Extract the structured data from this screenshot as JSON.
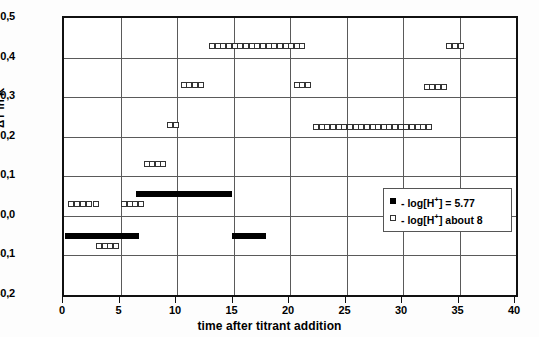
{
  "chart_data": {
    "type": "scatter",
    "title": "",
    "xlabel": "time after titrant addition",
    "ylabel": "ΔT in K",
    "xlim": [
      0,
      40
    ],
    "ylim": [
      -0.2,
      0.5
    ],
    "xticks": [
      "0",
      "5",
      "10",
      "15",
      "20",
      "25",
      "30",
      "35",
      "40"
    ],
    "xtick_values": [
      0,
      5,
      10,
      15,
      20,
      25,
      30,
      35,
      40
    ],
    "yticks": [
      "-0,2",
      "-0,1",
      "0,0",
      "0,1",
      "0,2",
      "0,3",
      "0,4",
      "0,5"
    ],
    "ytick_values": [
      -0.2,
      -0.1,
      0.0,
      0.1,
      0.2,
      0.3,
      0.4,
      0.5
    ],
    "grid": "both",
    "legend_position": "lower-right",
    "decimal_separator": ",",
    "series": [
      {
        "name": "- log[H+] = 5.77",
        "marker": "filled-square",
        "color": "#000000",
        "points": [
          [
            0.35,
            -0.05
          ],
          [
            0.85,
            -0.05
          ],
          [
            1.35,
            -0.05
          ],
          [
            1.85,
            -0.05
          ],
          [
            2.35,
            -0.05
          ],
          [
            2.85,
            -0.05
          ],
          [
            3.35,
            -0.05
          ],
          [
            3.85,
            -0.05
          ],
          [
            4.35,
            -0.05
          ],
          [
            4.85,
            -0.05
          ],
          [
            5.35,
            -0.05
          ],
          [
            5.9,
            -0.05
          ],
          [
            6.35,
            -0.05
          ],
          [
            6.6,
            0.055
          ],
          [
            7.1,
            0.055
          ],
          [
            7.6,
            0.055
          ],
          [
            8.1,
            0.055
          ],
          [
            8.6,
            0.055
          ],
          [
            9.1,
            0.055
          ],
          [
            9.6,
            0.055
          ],
          [
            10.1,
            0.055
          ],
          [
            10.6,
            0.055
          ],
          [
            11.1,
            0.055
          ],
          [
            11.6,
            0.055
          ],
          [
            12.1,
            0.055
          ],
          [
            12.6,
            0.055
          ],
          [
            13.1,
            0.055
          ],
          [
            13.6,
            0.055
          ],
          [
            14.1,
            0.055
          ],
          [
            14.6,
            0.055
          ],
          [
            15.1,
            -0.05
          ],
          [
            15.6,
            -0.05
          ],
          [
            16.1,
            -0.05
          ],
          [
            16.6,
            -0.05
          ],
          [
            17.1,
            -0.05
          ],
          [
            17.6,
            -0.05
          ]
        ]
      },
      {
        "name": "- log[H+] about 8",
        "marker": "open-square",
        "color": "#333333",
        "points": [
          [
            0.6,
            0.03
          ],
          [
            1.15,
            0.03
          ],
          [
            1.7,
            0.03
          ],
          [
            2.25,
            0.03
          ],
          [
            2.8,
            0.03
          ],
          [
            3.1,
            -0.075
          ],
          [
            3.6,
            -0.075
          ],
          [
            4.1,
            -0.075
          ],
          [
            4.6,
            -0.075
          ],
          [
            5.3,
            0.03
          ],
          [
            5.8,
            0.03
          ],
          [
            6.3,
            0.03
          ],
          [
            6.8,
            0.03
          ],
          [
            7.3,
            0.13
          ],
          [
            7.8,
            0.13
          ],
          [
            8.3,
            0.13
          ],
          [
            8.8,
            0.13
          ],
          [
            9.4,
            0.23
          ],
          [
            9.9,
            0.23
          ],
          [
            10.6,
            0.33
          ],
          [
            11.1,
            0.33
          ],
          [
            11.6,
            0.33
          ],
          [
            12.1,
            0.33
          ],
          [
            13.1,
            0.43
          ],
          [
            13.6,
            0.43
          ],
          [
            14.1,
            0.43
          ],
          [
            14.6,
            0.43
          ],
          [
            15.1,
            0.43
          ],
          [
            15.6,
            0.43
          ],
          [
            16.1,
            0.43
          ],
          [
            16.6,
            0.43
          ],
          [
            17.1,
            0.43
          ],
          [
            17.6,
            0.43
          ],
          [
            18.1,
            0.43
          ],
          [
            18.6,
            0.43
          ],
          [
            19.1,
            0.43
          ],
          [
            19.6,
            0.43
          ],
          [
            20.1,
            0.43
          ],
          [
            20.6,
            0.43
          ],
          [
            21.1,
            0.43
          ],
          [
            20.6,
            0.33
          ],
          [
            21.1,
            0.33
          ],
          [
            21.6,
            0.33
          ],
          [
            22.3,
            0.225
          ],
          [
            22.8,
            0.225
          ],
          [
            23.3,
            0.225
          ],
          [
            23.8,
            0.225
          ],
          [
            24.3,
            0.225
          ],
          [
            24.8,
            0.225
          ],
          [
            25.3,
            0.225
          ],
          [
            25.8,
            0.225
          ],
          [
            26.3,
            0.225
          ],
          [
            26.8,
            0.225
          ],
          [
            27.3,
            0.225
          ],
          [
            27.8,
            0.225
          ],
          [
            28.3,
            0.225
          ],
          [
            28.8,
            0.225
          ],
          [
            29.3,
            0.225
          ],
          [
            29.8,
            0.225
          ],
          [
            30.3,
            0.225
          ],
          [
            30.8,
            0.225
          ],
          [
            31.3,
            0.225
          ],
          [
            31.8,
            0.225
          ],
          [
            32.3,
            0.225
          ],
          [
            32.1,
            0.325
          ],
          [
            32.6,
            0.325
          ],
          [
            33.1,
            0.325
          ],
          [
            33.6,
            0.325
          ],
          [
            34.1,
            0.43
          ],
          [
            34.6,
            0.43
          ],
          [
            35.1,
            0.43
          ]
        ]
      }
    ]
  },
  "legend": {
    "entries": [
      {
        "prefix": "- log[H",
        "sup": "+",
        "suffix": "] = 5.77",
        "marker": "filled-square"
      },
      {
        "prefix": "- log[H",
        "sup": "+",
        "suffix": "] about 8",
        "marker": "open-square"
      }
    ]
  },
  "axes": {
    "x_title": "time after titrant addition",
    "y_title": "ΔT in K"
  }
}
